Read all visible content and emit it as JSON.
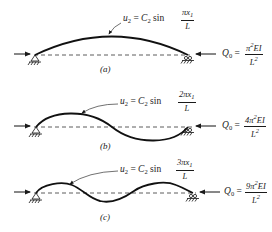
{
  "figure": {
    "panels": [
      {
        "id": "a",
        "caption": "(a)",
        "mode_shape": {
          "lhs": "u",
          "lhs_sub": "2",
          "coef": "C",
          "coef_sub": "2",
          "func": "sin",
          "num": "πx",
          "num_sub": "1",
          "den": "L"
        },
        "load": {
          "symbol": "Q",
          "symbol_sub": "0",
          "num_prefix": "π",
          "num_sup": "2",
          "num_suffix": "EI",
          "den": "L",
          "den_sup": "2"
        },
        "half_waves": 1
      },
      {
        "id": "b",
        "caption": "(b)",
        "mode_shape": {
          "lhs": "u",
          "lhs_sub": "2",
          "coef": "C",
          "coef_sub": "2",
          "func": "sin",
          "num": "2πx",
          "num_sub": "1",
          "den": "L"
        },
        "load": {
          "symbol": "Q",
          "symbol_sub": "0",
          "num_prefix": "4π",
          "num_sup": "2",
          "num_suffix": "EI",
          "den": "L",
          "den_sup": "2"
        },
        "half_waves": 2
      },
      {
        "id": "c",
        "caption": "(c)",
        "mode_shape": {
          "lhs": "u",
          "lhs_sub": "2",
          "coef": "C",
          "coef_sub": "2",
          "func": "sin",
          "num": "3πx",
          "num_sub": "1",
          "den": "L"
        },
        "load": {
          "symbol": "Q",
          "symbol_sub": "0",
          "num_prefix": "9π",
          "num_sup": "2",
          "num_suffix": "EI",
          "den": "L",
          "den_sup": "2"
        },
        "half_waves": 3
      }
    ],
    "colors": {
      "ink": "#1a1a1a",
      "background": "#ffffff"
    }
  }
}
